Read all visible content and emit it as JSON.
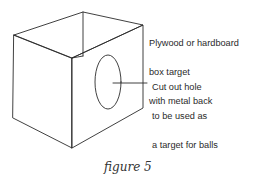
{
  "figure": {
    "caption": "figure 5",
    "labels": {
      "box": [
        "Plywood or hardboard",
        "box target",
        "with metal back"
      ],
      "hole": [
        "Cut out hole",
        "to be used as",
        "a target for balls"
      ]
    },
    "colors": {
      "line": "#2b2b2b",
      "text": "#2a2a2a",
      "background": "#ffffff"
    }
  }
}
